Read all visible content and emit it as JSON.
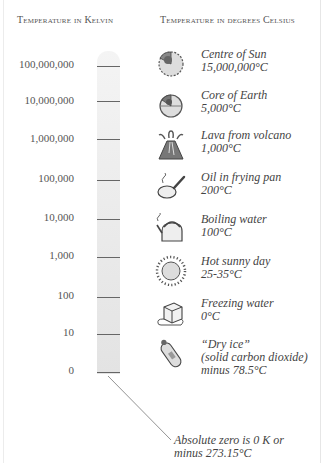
{
  "headers": {
    "kelvin": "Temperature in Kelvin",
    "celsius": "Temperature in degrees Celsius"
  },
  "kelvin_scale": [
    {
      "label": "100,000,000",
      "y": 66
    },
    {
      "label": "10,000,000",
      "y": 101
    },
    {
      "label": "1,000,000",
      "y": 139
    },
    {
      "label": "100,000",
      "y": 180
    },
    {
      "label": "10,000",
      "y": 219
    },
    {
      "label": "1,000",
      "y": 257
    },
    {
      "label": "100",
      "y": 297
    },
    {
      "label": "10",
      "y": 334
    },
    {
      "label": "0",
      "y": 372
    }
  ],
  "examples": [
    {
      "icon": "sun-cutaway-icon",
      "name": "Centre of Sun",
      "temp": "15,000,000°C",
      "y": 48
    },
    {
      "icon": "earth-core-icon",
      "name": "Core of Earth",
      "temp": "5,000°C",
      "y": 89
    },
    {
      "icon": "volcano-icon",
      "name": "Lava from volcano",
      "temp": "1,000°C",
      "y": 129
    },
    {
      "icon": "frying-pan-icon",
      "name": "Oil in frying pan",
      "temp": "200°C",
      "y": 171
    },
    {
      "icon": "kettle-icon",
      "name": "Boiling water",
      "temp": "100°C",
      "y": 213
    },
    {
      "icon": "sun-icon",
      "name": "Hot sunny day",
      "temp": "25-35°C",
      "y": 255
    },
    {
      "icon": "ice-cube-icon",
      "name": "Freezing water",
      "temp": "0°C",
      "y": 297
    },
    {
      "icon": "gas-cylinder-icon",
      "name": "“Dry ice”",
      "detail": "(solid carbon dioxide)",
      "temp": "minus 78.5°C",
      "y": 338
    }
  ],
  "annotation": {
    "line1": "Absolute zero is 0 K or",
    "line2": "minus 273.15°C"
  },
  "colors": {
    "bar_top": "#f4f4f4",
    "bar_bottom": "#e3e3e3",
    "tick": "#666666",
    "text": "#444444"
  }
}
